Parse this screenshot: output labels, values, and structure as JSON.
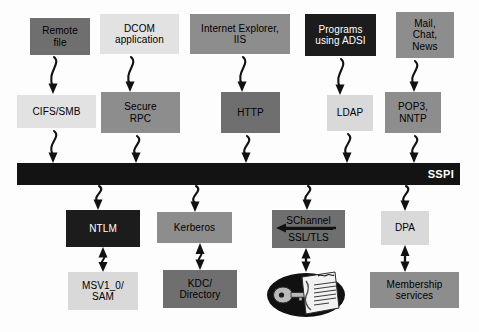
{
  "diagram": {
    "type": "block-diagram",
    "bar": {
      "label": "SSPI",
      "color": "#131313",
      "text_color": "#ffffff"
    },
    "colors": {
      "dark": "#1c1c1c",
      "mid": "#8d8d8d",
      "middark": "#6f6f6f",
      "light": "#d9d9d9",
      "lighter": "#e2e2e2",
      "background": "#fdfdfd",
      "stroke": "#111111"
    },
    "rows": {
      "applications": [
        {
          "id": "remote-file",
          "label": "Remote\nfile",
          "shade": "middark"
        },
        {
          "id": "dcom-application",
          "label": "DCOM\napplication",
          "shade": "lighter"
        },
        {
          "id": "internet-explorer-iis",
          "label": "Internet Explorer,\nIIS",
          "shade": "mid"
        },
        {
          "id": "programs-using-adsi",
          "label": "Programs\nusing ADSI",
          "shade": "dark"
        },
        {
          "id": "mail-chat-news",
          "label": "Mail,\nChat,\nNews",
          "shade": "mid"
        }
      ],
      "protocols": [
        {
          "id": "cifs-smb",
          "label": "CIFS/SMB",
          "shade": "lighter"
        },
        {
          "id": "secure-rpc",
          "label": "Secure\nRPC",
          "shade": "mid"
        },
        {
          "id": "http",
          "label": "HTTP",
          "shade": "middark"
        },
        {
          "id": "ldap",
          "label": "LDAP",
          "shade": "light"
        },
        {
          "id": "pop3-nntp",
          "label": "POP3,\nNNTP",
          "shade": "mid"
        }
      ],
      "providers": [
        {
          "id": "ntlm",
          "label": "NTLM",
          "shade": "dark"
        },
        {
          "id": "kerberos",
          "label": "Kerberos",
          "shade": "mid"
        },
        {
          "id": "schannel",
          "label_top": "SChannel",
          "label_bottom": "SSL/TLS",
          "shade": "middark"
        },
        {
          "id": "dpa",
          "label": "DPA",
          "shade": "light"
        }
      ],
      "stores": [
        {
          "id": "msv1-0-sam",
          "label": "MSV1_0/\nSAM",
          "shade": "light"
        },
        {
          "id": "kdc-directory",
          "label": "KDC/\nDirectory",
          "shade": "middark"
        },
        {
          "id": "certificate-store",
          "label": "",
          "shade": "icon"
        },
        {
          "id": "membership-services",
          "label": "Membership\nservices",
          "shade": "mid"
        }
      ]
    },
    "icons": {
      "certificate_store": "key-and-certificate-icon"
    }
  }
}
